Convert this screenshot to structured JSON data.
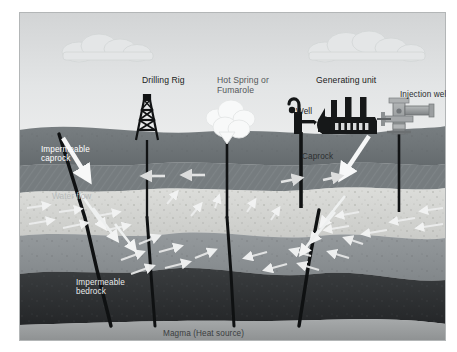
{
  "diagram": {
    "labels": {
      "drilling_rig": "Drilling Rig",
      "hot_spring": "Hot Spring or\nFumarole",
      "generating_unit": "Generating unit",
      "injection_well": "Injection well",
      "well": "Well",
      "caprock": "Caprock",
      "impermeable_caprock": "Impermeable\ncaprock",
      "water_flow": "Water flow",
      "impermeable_bedrock": "Impermeable\nbedrock",
      "magma": "Magma (Heat source)"
    },
    "colors": {
      "sky_top": "#d5d7d8",
      "sky_bottom": "#e9eaeb",
      "cloud": "#e2e4e5",
      "caprock": "#6e7477",
      "caprock_hatch": "#7e8487",
      "reservoir": "#d3d4d2",
      "mid_rock": "#8d9194",
      "bedrock": "#303335",
      "magma": "#9a9d9e",
      "pipe_black": "#111314",
      "equipment_black": "#161819",
      "arrow_white": "#f2f3f3",
      "frame_border": "#b9bbbc"
    },
    "elements": {
      "surface_equipment": [
        "drilling-rig-derrick",
        "fumarole-steam-plume",
        "well-hand-pump",
        "generating-unit-factory",
        "injection-well-valve"
      ],
      "strata": [
        "impermeable-caprock",
        "permeable-reservoir",
        "mid-rock",
        "impermeable-bedrock",
        "magma-heat-source"
      ],
      "flow_indicator": "water-flow-arrows"
    }
  }
}
